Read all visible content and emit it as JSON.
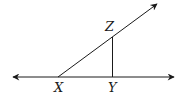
{
  "diagram": {
    "type": "geometry",
    "stroke_color": "#1a1a1a",
    "points": {
      "X": {
        "label": "X"
      },
      "Y": {
        "label": "Y"
      },
      "Z": {
        "label": "Z"
      }
    },
    "elements": [
      {
        "kind": "line",
        "description": "horizontal line with arrows on both ends through X and Y"
      },
      {
        "kind": "ray",
        "description": "ray from X through Z"
      },
      {
        "kind": "segment",
        "description": "vertical segment ZY"
      }
    ]
  }
}
